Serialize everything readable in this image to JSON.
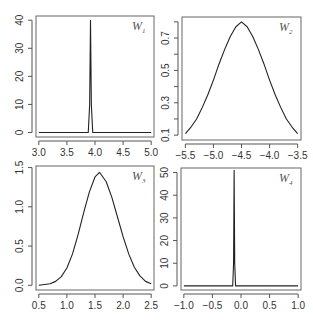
{
  "colors": {
    "line": "#222222",
    "axis": "#555555",
    "box": "#666666",
    "text": "#333333",
    "background": "#ffffff"
  },
  "chart_data": [
    {
      "type": "line",
      "panel": "top-left",
      "label": "W",
      "label_sub": "1",
      "xlabel": "",
      "ylabel": "",
      "xlim": [
        2.95,
        5.05
      ],
      "ylim": [
        -1.6,
        41.5
      ],
      "x_ticks": [
        3.0,
        3.5,
        4.0,
        4.5,
        5.0
      ],
      "x_tick_labels": [
        "3.0",
        "3.5",
        "4.0",
        "4.5",
        "5.0"
      ],
      "y_ticks": [
        0,
        10,
        20,
        30,
        40
      ],
      "y_tick_labels": [
        "0",
        "10",
        "20",
        "30",
        "40"
      ],
      "grid": false,
      "shape": "spike",
      "x": [
        3.0,
        3.88,
        3.905,
        3.92,
        3.935,
        3.96,
        5.0
      ],
      "y": [
        0,
        0,
        10,
        40,
        10,
        0,
        0
      ]
    },
    {
      "type": "line",
      "panel": "top-right",
      "label": "W",
      "label_sub": "2",
      "xlabel": "",
      "ylabel": "",
      "xlim": [
        -5.56,
        -3.44
      ],
      "ylim": [
        0.07,
        0.83
      ],
      "x_ticks": [
        -5.5,
        -5.0,
        -4.5,
        -4.0,
        -3.5
      ],
      "x_tick_labels": [
        "-5.5",
        "-5.0",
        "-4.5",
        "-4.0",
        "-3.5"
      ],
      "y_ticks": [
        0.1,
        0.2,
        0.3,
        0.4,
        0.5,
        0.6,
        0.7,
        0.8
      ],
      "y_tick_labels": [
        "0.1",
        "",
        "0.3",
        "",
        "0.5",
        "",
        "0.7",
        ""
      ],
      "grid": false,
      "shape": "gaussian",
      "x": [
        -5.5,
        -5.4,
        -5.3,
        -5.2,
        -5.1,
        -5.0,
        -4.9,
        -4.8,
        -4.7,
        -4.6,
        -4.5,
        -4.4,
        -4.3,
        -4.2,
        -4.1,
        -4.0,
        -3.9,
        -3.8,
        -3.7,
        -3.6,
        -3.5
      ],
      "y": [
        0.11,
        0.15,
        0.2,
        0.27,
        0.35,
        0.44,
        0.54,
        0.63,
        0.71,
        0.77,
        0.8,
        0.77,
        0.71,
        0.63,
        0.54,
        0.44,
        0.35,
        0.27,
        0.2,
        0.15,
        0.11
      ]
    },
    {
      "type": "line",
      "panel": "bottom-left",
      "label": "W",
      "label_sub": "3",
      "xlabel": "",
      "ylabel": "",
      "xlim": [
        0.45,
        2.55
      ],
      "ylim": [
        -0.06,
        1.52
      ],
      "x_ticks": [
        0.5,
        1.0,
        1.5,
        2.0,
        2.5
      ],
      "x_tick_labels": [
        "0.5",
        "1.0",
        "1.5",
        "2.0",
        "2.5"
      ],
      "y_ticks": [
        0.0,
        0.5,
        1.0,
        1.5
      ],
      "y_tick_labels": [
        "0.0",
        "0.5",
        "1.0",
        "1.5"
      ],
      "grid": false,
      "shape": "gaussian",
      "x": [
        0.5,
        0.6,
        0.7,
        0.8,
        0.9,
        1.0,
        1.1,
        1.2,
        1.3,
        1.4,
        1.5,
        1.58,
        1.7,
        1.8,
        1.9,
        2.0,
        2.1,
        2.2,
        2.3,
        2.4,
        2.5
      ],
      "y": [
        0.0,
        0.01,
        0.02,
        0.05,
        0.11,
        0.22,
        0.4,
        0.65,
        0.93,
        1.19,
        1.38,
        1.44,
        1.32,
        1.12,
        0.87,
        0.62,
        0.4,
        0.23,
        0.12,
        0.05,
        0.02
      ]
    },
    {
      "type": "line",
      "panel": "bottom-right",
      "label": "W",
      "label_sub": "4",
      "xlabel": "",
      "ylabel": "",
      "xlim": [
        -1.05,
        1.05
      ],
      "ylim": [
        -1.8,
        52
      ],
      "x_ticks": [
        -1.0,
        -0.5,
        0.0,
        0.5,
        1.0
      ],
      "x_tick_labels": [
        "-1.0",
        "-0.5",
        "0.0",
        "0.5",
        "1.0"
      ],
      "y_ticks": [
        0,
        10,
        20,
        30,
        40,
        50
      ],
      "y_tick_labels": [
        "0",
        "10",
        "20",
        "30",
        "40",
        "50"
      ],
      "grid": false,
      "shape": "spike",
      "x": [
        -1.0,
        -0.145,
        -0.13,
        -0.12,
        -0.11,
        -0.095,
        1.0
      ],
      "y": [
        0,
        0,
        10,
        51,
        10,
        0,
        0
      ]
    }
  ],
  "layout": {
    "panels": [
      {
        "box": [
          36,
          16,
          154,
          137
        ]
      },
      {
        "box": [
          182,
          17,
          301,
          140
        ]
      },
      {
        "box": [
          36,
          166,
          154,
          290
        ]
      },
      {
        "box": [
          181,
          168,
          301,
          290
        ]
      }
    ]
  }
}
